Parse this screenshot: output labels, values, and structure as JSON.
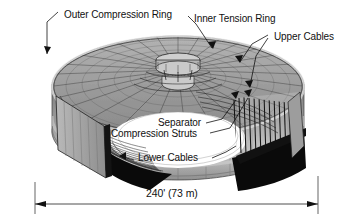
{
  "figure": {
    "type": "cutaway-isometric-diagram",
    "background_color": "#ffffff",
    "line_color": "#111111"
  },
  "labels": {
    "outer_compression_ring": "Outer Compression Ring",
    "inner_tension_ring": "Inner Tension Ring",
    "upper_cables": "Upper Cables",
    "separator": "Separator",
    "compression_struts": "Compression Struts",
    "lower_cables": "Lower Cables"
  },
  "dimension": {
    "span_label": "240' (73 m)",
    "feet": "240'",
    "meters": "73 m"
  },
  "colors": {
    "top_surface": "#9a9a9a",
    "top_surface_light": "#c2c2c2",
    "outer_wall": "#8d8d8d",
    "outer_wall_light": "#bdbdbd",
    "shadow": "#0a0a0a",
    "cut_face": "#a8a8a8",
    "void": "#ffffff",
    "ring_hub": "#c8c8c8",
    "cable_line": "#1a1a1a"
  }
}
